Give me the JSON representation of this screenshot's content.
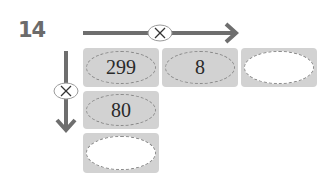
{
  "problem": {
    "number": "14",
    "operator_symbol": "×",
    "operator_name": "multiply",
    "grid": {
      "row1": [
        "299",
        "8",
        ""
      ],
      "column1": [
        "299",
        "80",
        ""
      ]
    }
  },
  "colors": {
    "arrow": "#6e6e6e",
    "box_fill": "#d2d2d2",
    "dash": "#8a8a8a",
    "number": "#6b6b6b"
  }
}
